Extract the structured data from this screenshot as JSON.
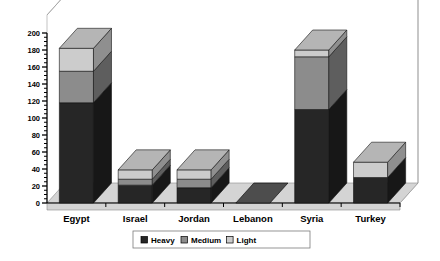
{
  "chart_data": {
    "type": "bar",
    "subtype": "stacked-3d-column",
    "title": "",
    "xlabel": "",
    "ylabel": "",
    "ylim": [
      0,
      200
    ],
    "yticks": [
      0,
      20,
      40,
      60,
      80,
      100,
      120,
      140,
      160,
      180,
      200
    ],
    "ytick_labels": [
      "0",
      "20",
      "40",
      "60",
      "80",
      "100",
      "120",
      "140",
      "160",
      "180",
      "200"
    ],
    "minor_tick_step": 5,
    "grid": false,
    "legend_position": "bottom-center",
    "categories": [
      "Egypt",
      "Israel",
      "Jordan",
      "Lebanon",
      "Syria",
      "Turkey"
    ],
    "series": [
      {
        "name": "Heavy",
        "color": "#262626",
        "values": [
          118,
          21,
          18,
          0,
          110,
          30
        ]
      },
      {
        "name": "Medium",
        "color": "#8c8c8c",
        "values": [
          37,
          7,
          10,
          0,
          62,
          0
        ]
      },
      {
        "name": "Light",
        "color": "#cccccc",
        "values": [
          27,
          11,
          11,
          0,
          8,
          18
        ]
      }
    ],
    "totals": [
      182,
      39,
      39,
      0,
      180,
      48
    ],
    "annotations": []
  },
  "legend": {
    "entries": [
      {
        "label": "Heavy",
        "swatch": "#262626"
      },
      {
        "label": "Medium",
        "swatch": "#8c8c8c"
      },
      {
        "label": "Light",
        "swatch": "#cccccc"
      }
    ]
  },
  "palette": {
    "background": "#ffffff",
    "wall": "#ffffff",
    "wall_line": "#9a9a9a",
    "floor": "#d4d4d4",
    "floor_line": "#8a8a8a",
    "axis": "#000000",
    "bar_top_heavy": "#4d4d4d",
    "bar_side_heavy": "#171717",
    "bar_top_medium": "#9e9e9e",
    "bar_side_medium": "#5e5e5e",
    "bar_top_light": "#b5b5b5",
    "bar_side_light": "#8f8f8f",
    "legend_border": "#7a7a7a"
  }
}
